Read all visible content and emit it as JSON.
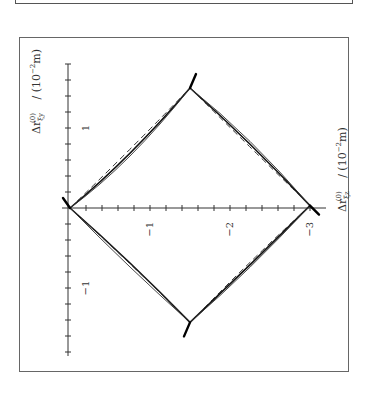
{
  "figure": {
    "top_fragment": "previous figure box (bottom edge only visible)"
  },
  "chart_data": {
    "type": "line",
    "orientation": "rotated 90° (labels read sideways)",
    "title": "",
    "xlabel": "Δr_ξz^(0) / (10^-2 m)",
    "ylabel": "Δr_ξy^(0) / (10^-2 m)",
    "xlabel_parts": {
      "delta": "Δr",
      "sub": "ξz",
      "sup": "(0)",
      "unit": " / (10",
      "unit_exp": "−2",
      "unit_end": "m)"
    },
    "ylabel_parts": {
      "delta": "Δr",
      "sub": "ξy",
      "sup": "(0)",
      "unit": " / (10",
      "unit_exp": "−2",
      "unit_end": "m)"
    },
    "x_ticks": [
      {
        "value": -1,
        "label": "−1"
      },
      {
        "value": -2,
        "label": "−2"
      },
      {
        "value": -3,
        "label": "−3"
      }
    ],
    "y_ticks": [
      {
        "value": 1,
        "label": "1"
      },
      {
        "value": -1,
        "label": "−1"
      }
    ],
    "minor_tick_step": 0.2,
    "xlim": [
      0.1,
      -3.2
    ],
    "ylim": [
      -1.85,
      1.8
    ],
    "grid": false,
    "legend": null,
    "series": [
      {
        "name": "thick solid curve",
        "style": "solid-thick",
        "points": [
          [
            0,
            0
          ],
          [
            -0.75,
            0.62
          ],
          [
            -1.5,
            1.5
          ],
          [
            -2.25,
            0.83
          ],
          [
            -3.0,
            0.03
          ],
          [
            -2.25,
            -0.72
          ],
          [
            -1.5,
            -1.43
          ],
          [
            -0.75,
            -0.66
          ],
          [
            0,
            0
          ]
        ]
      },
      {
        "name": "thin solid curve",
        "style": "solid-thin",
        "points": [
          [
            0,
            0
          ],
          [
            -0.75,
            0.55
          ],
          [
            -1.5,
            1.5
          ],
          [
            -2.25,
            0.9
          ],
          [
            -3.0,
            0.03
          ],
          [
            -2.25,
            -0.78
          ],
          [
            -1.5,
            -1.43
          ],
          [
            -0.75,
            -0.76
          ],
          [
            0,
            0
          ]
        ]
      },
      {
        "name": "dashed curve",
        "style": "dashed",
        "points": [
          [
            0,
            0
          ],
          [
            -0.75,
            0.72
          ],
          [
            -1.5,
            1.5
          ],
          [
            -2.25,
            0.76
          ],
          [
            -3.0,
            0.03
          ],
          [
            -2.25,
            -0.66
          ],
          [
            -1.5,
            -1.43
          ],
          [
            -0.75,
            -0.68
          ],
          [
            0,
            0
          ]
        ]
      }
    ],
    "vertex_markers": [
      {
        "at": [
          0,
          0
        ],
        "direction": "upper-left"
      },
      {
        "at": [
          -1.5,
          1.5
        ],
        "direction": "up-right"
      },
      {
        "at": [
          -3.0,
          0.03
        ],
        "direction": "down-right"
      },
      {
        "at": [
          -1.5,
          -1.43
        ],
        "direction": "down-left"
      }
    ]
  }
}
